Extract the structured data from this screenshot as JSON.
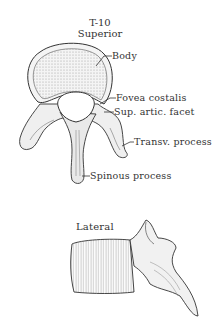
{
  "figure": {
    "superior_view": {
      "title_line1": "T-10",
      "title_line2": "Superior",
      "labels": [
        {
          "text": "Body"
        },
        {
          "text": "Fovea costalis"
        },
        {
          "text": "Sup. artic. facet"
        },
        {
          "text": "Transv. process"
        },
        {
          "text": "Spinous process"
        }
      ]
    },
    "lateral_view": {
      "title": "Lateral"
    },
    "colors": {
      "ink": "#333333",
      "background": "#ffffff",
      "stipple": "#bdbdbd"
    }
  }
}
